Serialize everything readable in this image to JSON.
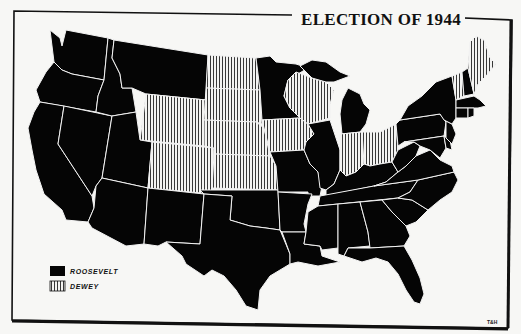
{
  "map": {
    "title": "ELECTION OF 1944",
    "credit": "T&H",
    "colors": {
      "roosevelt": "#050505",
      "dewey_bg": "#f4f4f2",
      "dewey_hatch": "#222222",
      "border_lines": "#f2f2f2",
      "paper": "#f7f7f5",
      "frame": "#111111"
    },
    "legend": [
      {
        "label": "ROOSEVELT",
        "swatch": "solid-black"
      },
      {
        "label": "DEWEY",
        "swatch": "vertical-hatch"
      }
    ],
    "states_dewey": [
      "Wyoming",
      "Colorado",
      "North Dakota",
      "South Dakota",
      "Nebraska",
      "Kansas",
      "Iowa",
      "Wisconsin",
      "Indiana",
      "Ohio",
      "Vermont",
      "Maine"
    ],
    "states_roosevelt": [
      "Washington",
      "Oregon",
      "California",
      "Nevada",
      "Idaho",
      "Montana",
      "Utah",
      "Arizona",
      "New Mexico",
      "Texas",
      "Oklahoma",
      "Minnesota",
      "Missouri",
      "Arkansas",
      "Louisiana",
      "Illinois",
      "Michigan",
      "Kentucky",
      "Tennessee",
      "Mississippi",
      "Alabama",
      "Georgia",
      "Florida",
      "South Carolina",
      "North Carolina",
      "Virginia",
      "West Virginia",
      "Maryland",
      "Delaware",
      "Pennsylvania",
      "New Jersey",
      "New York",
      "Connecticut",
      "Rhode Island",
      "Massachusetts",
      "New Hampshire"
    ]
  }
}
